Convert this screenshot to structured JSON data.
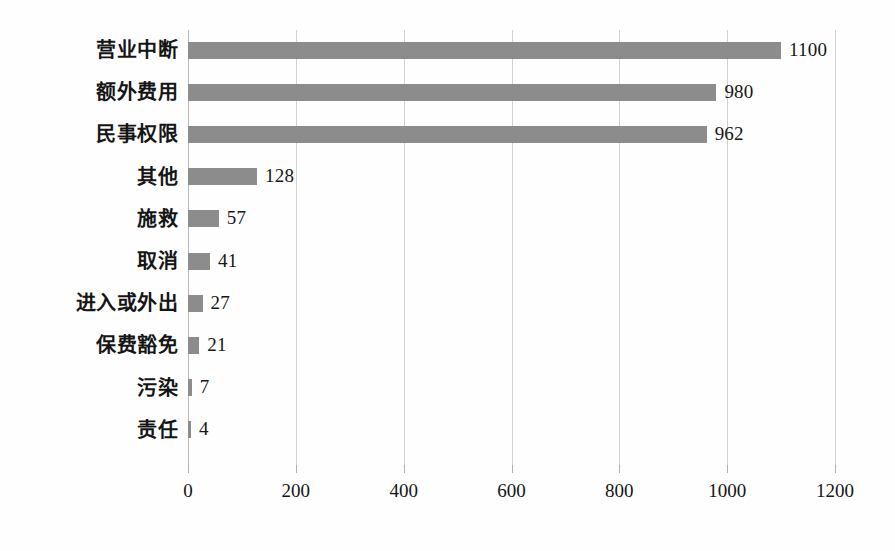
{
  "chart_data": {
    "type": "bar",
    "orientation": "horizontal",
    "title": "",
    "subtitle": "",
    "xlabel": "",
    "ylabel": "",
    "xlim": [
      0,
      1200
    ],
    "ylim": null,
    "grid": true,
    "legend": null,
    "legend_position": "none",
    "bar_color": "#8c8c8c",
    "gridline_color": "#d2d2d2",
    "axis_color": "#b9b9b9",
    "xticks": [
      0,
      200,
      400,
      600,
      800,
      1000,
      1200
    ],
    "xtick_labels": [
      "0",
      "200",
      "400",
      "600",
      "800",
      "1000",
      "1200"
    ],
    "categories": [
      "营业中断",
      "额外费用",
      "民事权限",
      "其他",
      "施救",
      "取消",
      "进入或外出",
      "保费豁免",
      "污染",
      "责任"
    ],
    "values": [
      1100,
      980,
      962,
      128,
      57,
      41,
      27,
      21,
      7,
      4
    ],
    "value_labels": [
      "1100",
      "980",
      "962",
      "128",
      "57",
      "41",
      "27",
      "21",
      "7",
      "4"
    ],
    "bars": [
      {
        "category": "营业中断",
        "value": 1100,
        "label": "1100"
      },
      {
        "category": "额外费用",
        "value": 980,
        "label": "980"
      },
      {
        "category": "民事权限",
        "value": 962,
        "label": "962"
      },
      {
        "category": "其他",
        "value": 128,
        "label": "128"
      },
      {
        "category": "施救",
        "value": 57,
        "label": "57"
      },
      {
        "category": "取消",
        "value": 41,
        "label": "41"
      },
      {
        "category": "进入或外出",
        "value": 27,
        "label": "27"
      },
      {
        "category": "保费豁免",
        "value": 21,
        "label": "21"
      },
      {
        "category": "污染",
        "value": 7,
        "label": "7"
      },
      {
        "category": "责任",
        "value": 4,
        "label": "4"
      }
    ]
  }
}
